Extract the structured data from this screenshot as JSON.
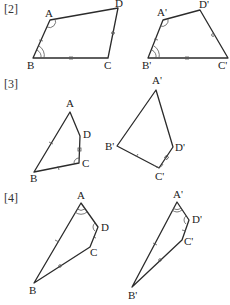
{
  "problems": [
    {
      "label": "[2]",
      "figure1": {
        "A": "A",
        "B": "B",
        "C": "C",
        "D": "D"
      },
      "figure2": {
        "A": "A'",
        "B": "B'",
        "C": "C'",
        "D": "D'"
      }
    },
    {
      "label": "[3]",
      "figure1": {
        "A": "A",
        "B": "B",
        "C": "C",
        "D": "D"
      },
      "figure2": {
        "A": "A'",
        "B": "B'",
        "C": "C'",
        "D": "D'"
      }
    },
    {
      "label": "[4]",
      "figure1": {
        "A": "A",
        "B": "B",
        "C": "C",
        "D": "D"
      },
      "figure2": {
        "A": "A'",
        "B": "B'",
        "C": "C'",
        "D": "D'"
      }
    }
  ],
  "colors": {
    "stroke": "#2b2b2b",
    "background": "#ffffff"
  }
}
